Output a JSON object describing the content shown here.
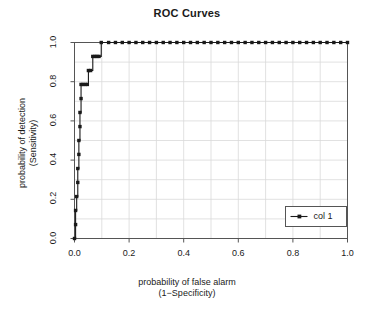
{
  "chart_data": {
    "type": "line",
    "title": "ROC Curves",
    "xlabel": "probability of false alarm",
    "xlabel_line2": "(1−Specificity)",
    "ylabel": "probability of detection",
    "ylabel_line2": "(Sensitivity)",
    "xlim": [
      0.0,
      1.0
    ],
    "ylim": [
      0.0,
      1.0
    ],
    "grid": true,
    "grid_color": "#d9d9d9",
    "axis_color": "#555555",
    "series_color": "#1a1a1a",
    "legend_position": "bottom-right",
    "x_ticks": [
      "0.0",
      "0.2",
      "0.4",
      "0.6",
      "0.8",
      "1.0"
    ],
    "x_tick_values": [
      0.0,
      0.2,
      0.4,
      0.6,
      0.8,
      1.0
    ],
    "y_ticks": [
      "0.0",
      "0.2",
      "0.4",
      "0.6",
      "0.8",
      "1.0"
    ],
    "y_tick_values": [
      0.0,
      0.2,
      0.4,
      0.6,
      0.8,
      1.0
    ],
    "legend": [
      {
        "label": "col 1",
        "marker": "filled-circle",
        "color": "#1a1a1a"
      }
    ],
    "series": [
      {
        "name": "col 1",
        "marker": "filled-circle",
        "points": [
          [
            0.0,
            0.0
          ],
          [
            0.004,
            0.071
          ],
          [
            0.004,
            0.143
          ],
          [
            0.008,
            0.214
          ],
          [
            0.012,
            0.286
          ],
          [
            0.012,
            0.357
          ],
          [
            0.016,
            0.429
          ],
          [
            0.016,
            0.5
          ],
          [
            0.02,
            0.571
          ],
          [
            0.02,
            0.643
          ],
          [
            0.024,
            0.714
          ],
          [
            0.024,
            0.786
          ],
          [
            0.031,
            0.786
          ],
          [
            0.039,
            0.786
          ],
          [
            0.047,
            0.786
          ],
          [
            0.051,
            0.857
          ],
          [
            0.059,
            0.857
          ],
          [
            0.067,
            0.929
          ],
          [
            0.075,
            0.929
          ],
          [
            0.082,
            0.929
          ],
          [
            0.09,
            0.929
          ],
          [
            0.098,
            1.0
          ],
          [
            0.125,
            1.0
          ],
          [
            0.15,
            1.0
          ],
          [
            0.175,
            1.0
          ],
          [
            0.2,
            1.0
          ],
          [
            0.225,
            1.0
          ],
          [
            0.25,
            1.0
          ],
          [
            0.275,
            1.0
          ],
          [
            0.3,
            1.0
          ],
          [
            0.325,
            1.0
          ],
          [
            0.35,
            1.0
          ],
          [
            0.375,
            1.0
          ],
          [
            0.4,
            1.0
          ],
          [
            0.425,
            1.0
          ],
          [
            0.45,
            1.0
          ],
          [
            0.475,
            1.0
          ],
          [
            0.5,
            1.0
          ],
          [
            0.525,
            1.0
          ],
          [
            0.55,
            1.0
          ],
          [
            0.575,
            1.0
          ],
          [
            0.6,
            1.0
          ],
          [
            0.625,
            1.0
          ],
          [
            0.65,
            1.0
          ],
          [
            0.675,
            1.0
          ],
          [
            0.7,
            1.0
          ],
          [
            0.725,
            1.0
          ],
          [
            0.75,
            1.0
          ],
          [
            0.775,
            1.0
          ],
          [
            0.8,
            1.0
          ],
          [
            0.825,
            1.0
          ],
          [
            0.85,
            1.0
          ],
          [
            0.875,
            1.0
          ],
          [
            0.9,
            1.0
          ],
          [
            0.925,
            1.0
          ],
          [
            0.95,
            1.0
          ],
          [
            0.975,
            1.0
          ],
          [
            1.0,
            1.0
          ]
        ]
      }
    ]
  }
}
